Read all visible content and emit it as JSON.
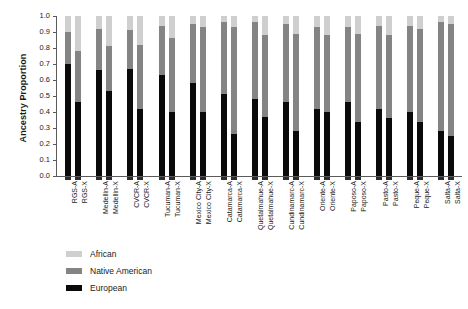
{
  "chart_data": {
    "type": "bar",
    "subtype": "stacked-bar",
    "title": "",
    "xlabel": "",
    "ylabel": "Ancestry Proportion",
    "ylim": [
      0.0,
      1.0
    ],
    "ytick_labels": [
      "1.0",
      "0.9",
      "0.8",
      "0.7",
      "0.6",
      "0.5",
      "0.4",
      "0.3",
      "0.2",
      "0.1",
      "0.0"
    ],
    "ytick_values": [
      1.0,
      0.9,
      0.8,
      0.7,
      0.6,
      0.5,
      0.4,
      0.3,
      0.2,
      0.1,
      0.0
    ],
    "grid": false,
    "legend_position": "bottom-left",
    "categories": [
      "RGS-A",
      "RGS-X",
      "Medellin-A",
      "Medellin-X",
      "CVCR-A",
      "CVCR-X",
      "Tucuman-A",
      "Tucuman-X",
      "Mexico City-A",
      "Mexico City-X",
      "Catamarca-A",
      "Catamarca-X",
      "Quetalmahue-A",
      "Quetalmahue-X",
      "Cundinamarc-A",
      "Cundinamarc-X",
      "Oriente-A",
      "Oriente-X",
      "Paposo-A",
      "Paposo-X",
      "Pasto-A",
      "Pasto-X",
      "Peque-A",
      "Peque-X",
      "Salta-A",
      "Salta-X"
    ],
    "series": [
      {
        "name": "European",
        "color": "#0a0a0a",
        "values": [
          0.7,
          0.46,
          0.66,
          0.53,
          0.67,
          0.42,
          0.63,
          0.4,
          0.58,
          0.4,
          0.51,
          0.26,
          0.48,
          0.37,
          0.46,
          0.28,
          0.42,
          0.4,
          0.46,
          0.34,
          0.42,
          0.36,
          0.4,
          0.34,
          0.28,
          0.25
        ]
      },
      {
        "name": "Native American",
        "color": "#848484",
        "values": [
          0.2,
          0.32,
          0.26,
          0.28,
          0.24,
          0.4,
          0.31,
          0.46,
          0.37,
          0.53,
          0.45,
          0.67,
          0.48,
          0.51,
          0.49,
          0.61,
          0.51,
          0.48,
          0.47,
          0.55,
          0.52,
          0.52,
          0.54,
          0.58,
          0.68,
          0.7
        ]
      },
      {
        "name": "African",
        "color": "#cfcfcf",
        "values": [
          0.1,
          0.22,
          0.08,
          0.19,
          0.09,
          0.18,
          0.06,
          0.14,
          0.05,
          0.07,
          0.04,
          0.07,
          0.04,
          0.12,
          0.05,
          0.11,
          0.07,
          0.12,
          0.07,
          0.11,
          0.06,
          0.12,
          0.06,
          0.08,
          0.04,
          0.05
        ]
      }
    ],
    "legend_entries": [
      {
        "label": "African",
        "color": "#cfcfcf"
      },
      {
        "label": "Native American",
        "color": "#848484"
      },
      {
        "label": "European",
        "color": "#0a0a0a"
      }
    ],
    "group_pairs": [
      "RGS",
      "Medellin",
      "CVCR",
      "Tucuman",
      "Mexico City",
      "Catamarca",
      "Quetalmahue",
      "Cundinamarc",
      "Oriente",
      "Paposo",
      "Pasto",
      "Peque",
      "Salta"
    ]
  }
}
